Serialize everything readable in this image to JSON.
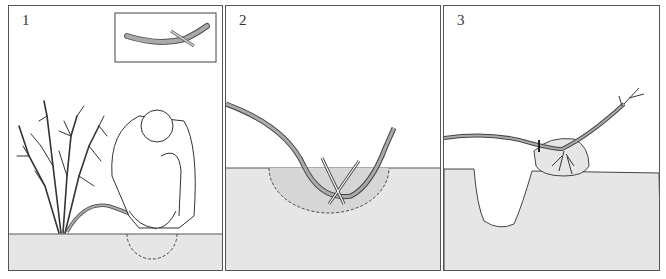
{
  "figure": {
    "panels": [
      {
        "number": "1",
        "description": "Person bending a low branch of a shrub down to the ground and making a slanting cut on its underside; inset shows the cut branch with a sliver wedged in the slit"
      },
      {
        "number": "2",
        "description": "Cut section of the branch buried in a shallow hole in the soil and pinned down with crossed pegs, tip bent upward"
      },
      {
        "number": "3",
        "description": "Rooted layer with a root ball lifted from the soil, severed from the parent plant; empty hole left in the ground"
      }
    ],
    "colors": {
      "ground": "#e6e6e6",
      "branch": "#a8a8a8",
      "outline": "#444444",
      "frame": "#555555"
    }
  }
}
